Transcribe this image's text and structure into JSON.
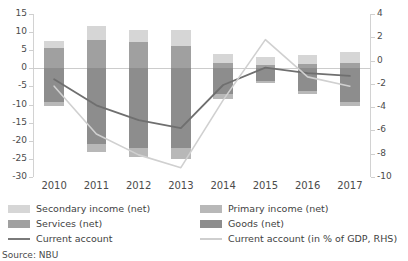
{
  "chart_data": {
    "type": "bar",
    "title": "",
    "subtitle": "",
    "xlabel": "",
    "ylabel": "",
    "categories": [
      "2010",
      "2011",
      "2012",
      "2013",
      "2014",
      "2015",
      "2016",
      "2017"
    ],
    "grid": false,
    "stacked": true,
    "legend_position": "bottom",
    "axes": {
      "left": {
        "label": "",
        "ylim": [
          -30,
          15
        ],
        "ticks": [
          15,
          10,
          5,
          0,
          -5,
          -10,
          -15,
          -20,
          -25,
          -30
        ],
        "tick_labels": [
          "15",
          "10",
          "5",
          "0",
          "-5",
          "-10",
          "-15",
          "-20",
          "-25",
          "-30"
        ]
      },
      "right": {
        "label": "",
        "ylim": [
          -10,
          4
        ],
        "ticks": [
          4,
          2,
          0,
          -2,
          -4,
          -6,
          -8,
          -10
        ],
        "tick_labels": [
          "4",
          "2",
          "0",
          "-2",
          "-4",
          "-6",
          "-8",
          "-10"
        ]
      }
    },
    "series": [
      {
        "name": "Goods (net)",
        "type": "bar-stack",
        "axis": "left",
        "color": "#8d8d8d",
        "values": [
          -9.3,
          -21.0,
          -22.0,
          -22.1,
          -7.1,
          -3.5,
          -6.2,
          -9.4
        ]
      },
      {
        "name": "Services (net)",
        "type": "bar-stack",
        "axis": "left",
        "color": "#a0a0a0",
        "values": [
          5.5,
          7.9,
          7.3,
          6.2,
          1.5,
          0.9,
          1.1,
          1.4
        ]
      },
      {
        "name": "Primary income (net)",
        "type": "bar-stack",
        "axis": "left",
        "color": "#b8b8b8",
        "values": [
          -1.0,
          -2.2,
          -2.5,
          -2.8,
          -1.3,
          -0.6,
          -0.8,
          -1.1
        ]
      },
      {
        "name": "Secondary income (net)",
        "type": "bar-stack",
        "axis": "left",
        "color": "#d6d6d6",
        "values": [
          2.1,
          3.7,
          3.3,
          4.4,
          2.5,
          2.2,
          2.5,
          3.2
        ]
      },
      {
        "name": "Current account",
        "type": "line",
        "axis": "left",
        "color": "#6f6f6f",
        "values": [
          -3.0,
          -10.2,
          -14.3,
          -16.5,
          -4.6,
          0.2,
          -1.3,
          -2.1
        ]
      },
      {
        "name": "Current account (in % of GDP, RHS)",
        "type": "line",
        "axis": "right",
        "color": "#d0d0d0",
        "values": [
          -2.2,
          -6.3,
          -8.1,
          -9.2,
          -3.4,
          1.8,
          -1.4,
          -2.2
        ]
      }
    ]
  },
  "legend": {
    "items": [
      {
        "label": "Secondary income (net)",
        "marker": "swatch",
        "color": "#d6d6d6"
      },
      {
        "label": "Primary income (net)",
        "marker": "swatch",
        "color": "#b8b8b8"
      },
      {
        "label": "Services (net)",
        "marker": "swatch",
        "color": "#a0a0a0"
      },
      {
        "label": "Goods (net)",
        "marker": "swatch",
        "color": "#8d8d8d"
      },
      {
        "label": "Current account",
        "marker": "line",
        "color": "#7a7a7a"
      },
      {
        "label": "Current account (in % of GDP, RHS)",
        "marker": "line",
        "color": "#cfcfcf"
      }
    ]
  },
  "source": {
    "text": "Source: NBU"
  }
}
